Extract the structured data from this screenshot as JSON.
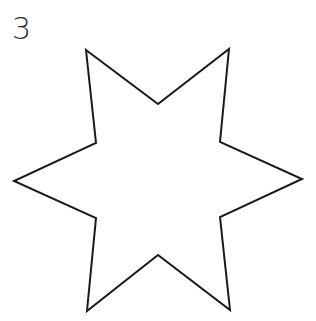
{
  "figure": {
    "number_label": "3",
    "shape": "six-pointed-star",
    "stroke_color": "#1a1a1a",
    "fill_color": "#ffffff",
    "stroke_width": 2,
    "points": "86,50 158,104 229,49 220,142 302,179 220,217 230,310 158,255 87,311 96,218 14,181 96,143"
  }
}
